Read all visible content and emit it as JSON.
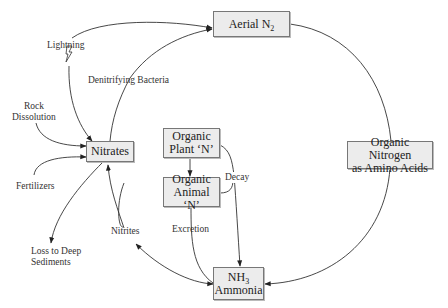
{
  "diagram": {
    "nodes": {
      "aerial_n2": {
        "label": "Aerial N",
        "sub": "2"
      },
      "nitrates": {
        "label": "Nitrates"
      },
      "organic_plant": {
        "line1": "Organic",
        "line2": "Plant ‘N’"
      },
      "organic_animal": {
        "line1": "Organic",
        "line2": "Animal ‘N’"
      },
      "organic_nitrogen": {
        "line1": "Organic Nitrogen",
        "line2": "as Amino Acids"
      },
      "ammonia": {
        "line1": "NH",
        "line1_sub": "3",
        "line2": "Ammonia"
      }
    },
    "edge_labels": {
      "lightning": "Lightning",
      "denitrifying": "Denitrifying Bacteria",
      "rock_line1": "Rock",
      "rock_line2": "Dissolution",
      "fertilizers": "Fertilizers",
      "loss_line1": "Loss to Deep",
      "loss_line2": "Sediments",
      "nitrites": "Nitrites",
      "excretion": "Excretion",
      "decay": "Decay"
    },
    "edges": [
      {
        "from": "lightning",
        "to": "aerial_n2"
      },
      {
        "from": "lightning",
        "to": "nitrates"
      },
      {
        "from": "nitrates",
        "to": "aerial_n2",
        "label": "Denitrifying Bacteria"
      },
      {
        "from": "rock_dissolution",
        "to": "nitrates"
      },
      {
        "from": "fertilizers",
        "to": "nitrates"
      },
      {
        "from": "nitrates",
        "to": "loss_to_deep_sediments"
      },
      {
        "from": "ammonia",
        "to": "nitrates",
        "label": "Nitrites",
        "bidirectional": true
      },
      {
        "from": "organic_plant",
        "to": "organic_animal"
      },
      {
        "from": "organic_plant",
        "to": "ammonia",
        "label": "Decay"
      },
      {
        "from": "organic_animal",
        "to": "ammonia",
        "label": "Decay"
      },
      {
        "from": "organic_animal",
        "to": "ammonia",
        "label": "Excretion"
      },
      {
        "from": "aerial_n2",
        "to": "organic_nitrogen"
      },
      {
        "from": "organic_nitrogen",
        "to": "ammonia"
      }
    ]
  }
}
